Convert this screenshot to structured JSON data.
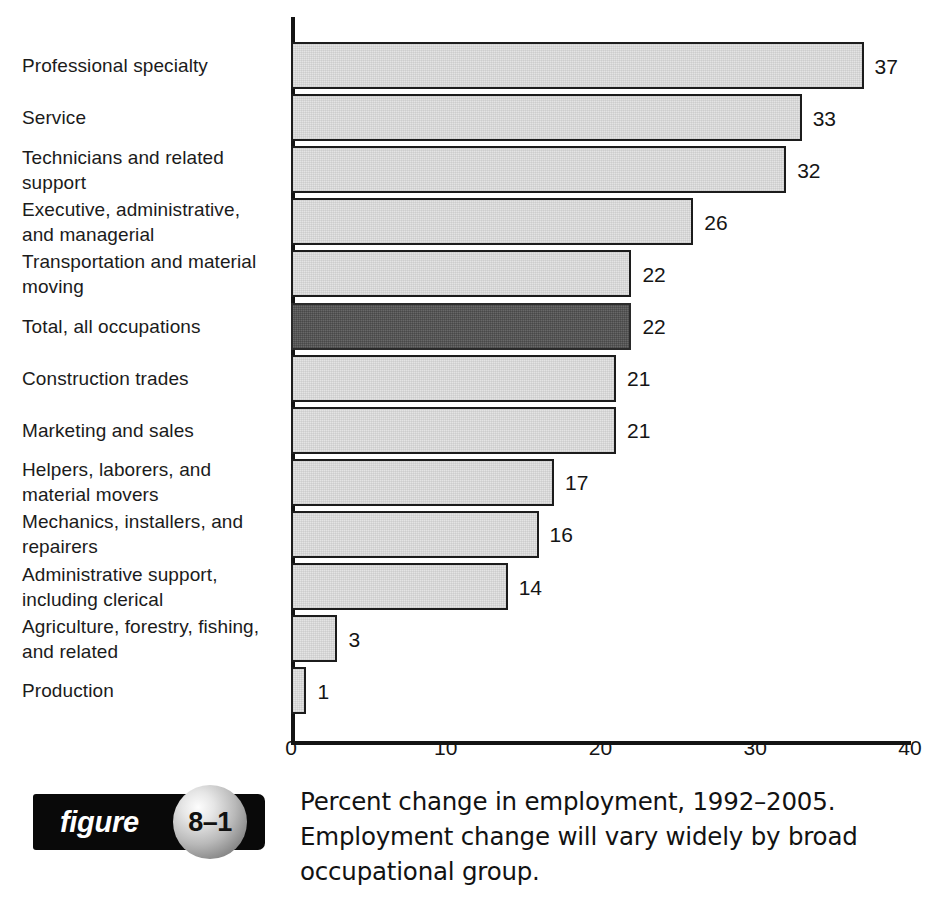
{
  "chart_data": {
    "type": "bar",
    "orientation": "horizontal",
    "title": "",
    "xlabel": "",
    "ylabel": "",
    "xlim": [
      0,
      40
    ],
    "xticks": [
      "0",
      "10",
      "20",
      "30",
      "40"
    ],
    "grid": false,
    "legend": false,
    "highlight_category": "Total, all occupations",
    "colors": {
      "bar_fill": "#e4e4e4",
      "bar_border": "#1c1c1c",
      "highlight_fill": "#575757",
      "axis": "#141414",
      "text": "#1a1a1a"
    },
    "categories": [
      "Professional specialty",
      "Service",
      "Technicians and related\nsupport",
      "Executive, administrative,\nand managerial",
      "Transportation and material\nmoving",
      "Total, all occupations",
      "Construction trades",
      "Marketing and sales",
      "Helpers, laborers, and\nmaterial movers",
      "Mechanics, installers, and\nrepairers",
      "Administrative support,\nincluding clerical",
      "Agriculture, forestry, fishing,\nand related",
      "Production"
    ],
    "values": [
      37,
      33,
      32,
      26,
      22,
      22,
      21,
      21,
      17,
      16,
      14,
      3,
      1
    ],
    "value_labels": [
      "37",
      "33",
      "32",
      "26",
      "22",
      "22",
      "21",
      "21",
      "17",
      "16",
      "14",
      "3",
      "1"
    ],
    "highlight_flags": [
      false,
      false,
      false,
      false,
      false,
      true,
      false,
      false,
      false,
      false,
      false,
      false,
      false
    ]
  },
  "figure": {
    "badge_word": "figure",
    "badge_number": "8–1",
    "caption_lines": [
      "Percent change in employment, 1992–2005.",
      "Employment change will vary widely by broad",
      "occupational group."
    ]
  }
}
